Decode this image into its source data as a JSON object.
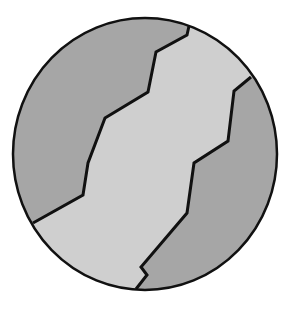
{
  "diagram": {
    "type": "circular cross-section with jagged boundaries",
    "circle": {
      "cx": 145,
      "cy": 154,
      "rx": 132,
      "ry": 136
    },
    "stroke_color": "#111111",
    "regions": [
      {
        "name": "upper-left-region",
        "fill": "#a6a6a6",
        "points": "189,26 187,35 156,52 148,92 105,118 88,163 83,195 33,223"
      },
      {
        "name": "middle-band-region",
        "fill": "#cfcfcf"
      },
      {
        "name": "lower-right-region",
        "fill": "#a6a6a6",
        "points": "251,77 234,91 228,141 194,163 187,213 141,267 147,275 136,289"
      }
    ],
    "boundaries": [
      {
        "name": "upper-boundary",
        "points": "189,26 187,35 156,52 148,92 105,118 88,163 83,195 33,223"
      },
      {
        "name": "lower-boundary",
        "points": "251,77 234,91 228,141 194,163 187,213 141,267 147,275 136,289"
      }
    ]
  }
}
